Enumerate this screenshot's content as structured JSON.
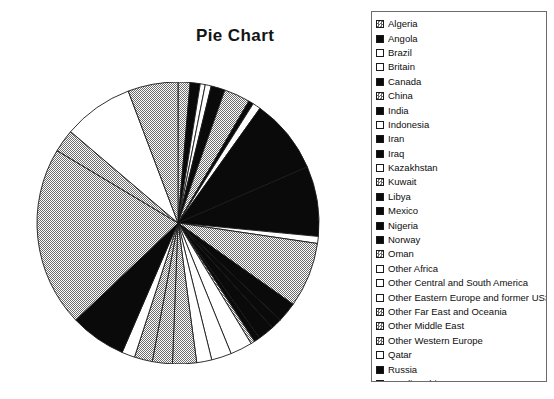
{
  "title": "Pie Chart",
  "colors": {
    "background": "#ffffff",
    "text": "#0d0d0d",
    "legend_border": "#6b6b6b",
    "slice_outline": "#1a1a1a"
  },
  "legend": {
    "items": [
      {
        "label": "Algeria",
        "swatch": "gray-checked"
      },
      {
        "label": "Angola",
        "swatch": "black"
      },
      {
        "label": "Brazil",
        "swatch": "white"
      },
      {
        "label": "Britain",
        "swatch": "white"
      },
      {
        "label": "Canada",
        "swatch": "black"
      },
      {
        "label": "China",
        "swatch": "gray-checked"
      },
      {
        "label": "India",
        "swatch": "black"
      },
      {
        "label": "Indonesia",
        "swatch": "white"
      },
      {
        "label": "Iran",
        "swatch": "black"
      },
      {
        "label": "Iraq",
        "swatch": "black"
      },
      {
        "label": "Kazakhstan",
        "swatch": "white"
      },
      {
        "label": "Kuwait",
        "swatch": "gray-checked"
      },
      {
        "label": "Libya",
        "swatch": "black"
      },
      {
        "label": "Mexico",
        "swatch": "black"
      },
      {
        "label": "Nigeria",
        "swatch": "black"
      },
      {
        "label": "Norway",
        "swatch": "black"
      },
      {
        "label": "Oman",
        "swatch": "gray-checked"
      },
      {
        "label": "Other Africa",
        "swatch": "white"
      },
      {
        "label": "Other Central and South America",
        "swatch": "white"
      },
      {
        "label": "Other Eastern Europe and former USSR",
        "swatch": "white"
      },
      {
        "label": "Other Far East and Oceania",
        "swatch": "gray-checked"
      },
      {
        "label": "Other Middle East",
        "swatch": "gray-checked"
      },
      {
        "label": "Other Western Europe",
        "swatch": "gray-checked"
      },
      {
        "label": "Qatar",
        "swatch": "white"
      },
      {
        "label": "Russia",
        "swatch": "black"
      },
      {
        "label": "Saudi Arabia",
        "swatch": "gray-checked"
      },
      {
        "label": "U.S.",
        "swatch": "gray-checked"
      },
      {
        "label": "United Arab Emirates",
        "swatch": "white"
      },
      {
        "label": "Venezuela",
        "swatch": "gray-checked"
      }
    ]
  },
  "chart_data": {
    "type": "pie",
    "title": "Pie Chart",
    "legend_position": "right",
    "start_angle_deg": -90,
    "direction": "clockwise",
    "center": {
      "x": 142,
      "y": 141
    },
    "radius": 141,
    "categories": [
      "Algeria",
      "Angola",
      "Brazil",
      "Britain",
      "Canada",
      "China",
      "India",
      "Indonesia",
      "Iran",
      "Iraq",
      "Kazakhstan",
      "Kuwait",
      "Libya",
      "Mexico",
      "Nigeria",
      "Norway",
      "Oman",
      "Other Africa",
      "Other Central and South America",
      "Other Eastern Europe and former USSR",
      "Other Far East and Oceania",
      "Other Middle East",
      "Other Western Europe",
      "Qatar",
      "Russia",
      "Saudi Arabia",
      "U.S.",
      "United Arab Emirates",
      "Venezuela"
    ],
    "values": [
      1.2,
      1.0,
      0.5,
      0.6,
      1.4,
      2.6,
      0.5,
      0.8,
      7.5,
      7.0,
      0.7,
      6.5,
      2.0,
      1.1,
      1.6,
      0.6,
      0.4,
      2.2,
      2.0,
      1.5,
      2.4,
      2.0,
      1.8,
      1.3,
      5.6,
      18.0,
      2.3,
      7.0,
      5.0
    ],
    "fills": [
      "gray-checked",
      "black",
      "white",
      "white",
      "black",
      "gray-checked",
      "black",
      "white",
      "black",
      "black",
      "white",
      "gray-checked",
      "black",
      "black",
      "black",
      "black",
      "gray-checked",
      "white",
      "white",
      "white",
      "gray-checked",
      "gray-checked",
      "gray-checked",
      "white",
      "black",
      "gray-checked",
      "gray-checked",
      "white",
      "gray-checked"
    ]
  }
}
